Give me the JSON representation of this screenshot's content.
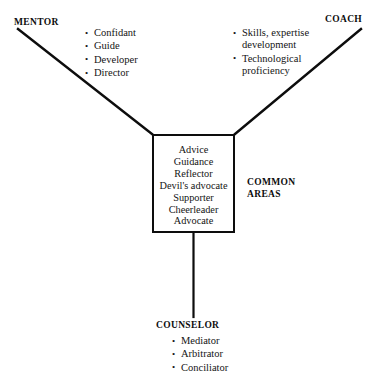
{
  "diagram": {
    "colors": {
      "line": "#0d0d0d",
      "text": "#141414",
      "background": "#ffffff"
    },
    "branches": [
      {
        "key": "mentor",
        "label": "MENTOR",
        "items": [
          "Confidant",
          "Guide",
          "Developer",
          "Director"
        ]
      },
      {
        "key": "coach",
        "label": "COACH",
        "items": [
          "Skills, expertise",
          "development",
          "Technological",
          "proficiency"
        ],
        "bullet_groups": [
          [
            "Skills, expertise",
            "development"
          ],
          [
            "Technological",
            "proficiency"
          ]
        ]
      },
      {
        "key": "counselor",
        "label": "COUNSELOR",
        "items": [
          "Mediator",
          "Arbitrator",
          "Conciliator"
        ]
      }
    ],
    "center": {
      "label": "COMMON AREAS",
      "label_line1": "COMMON",
      "label_line2": "AREAS",
      "items": [
        "Advice",
        "Guidance",
        "Reflector",
        "Devil's advocate",
        "Supporter",
        "Cheerleader",
        "Advocate"
      ]
    }
  }
}
